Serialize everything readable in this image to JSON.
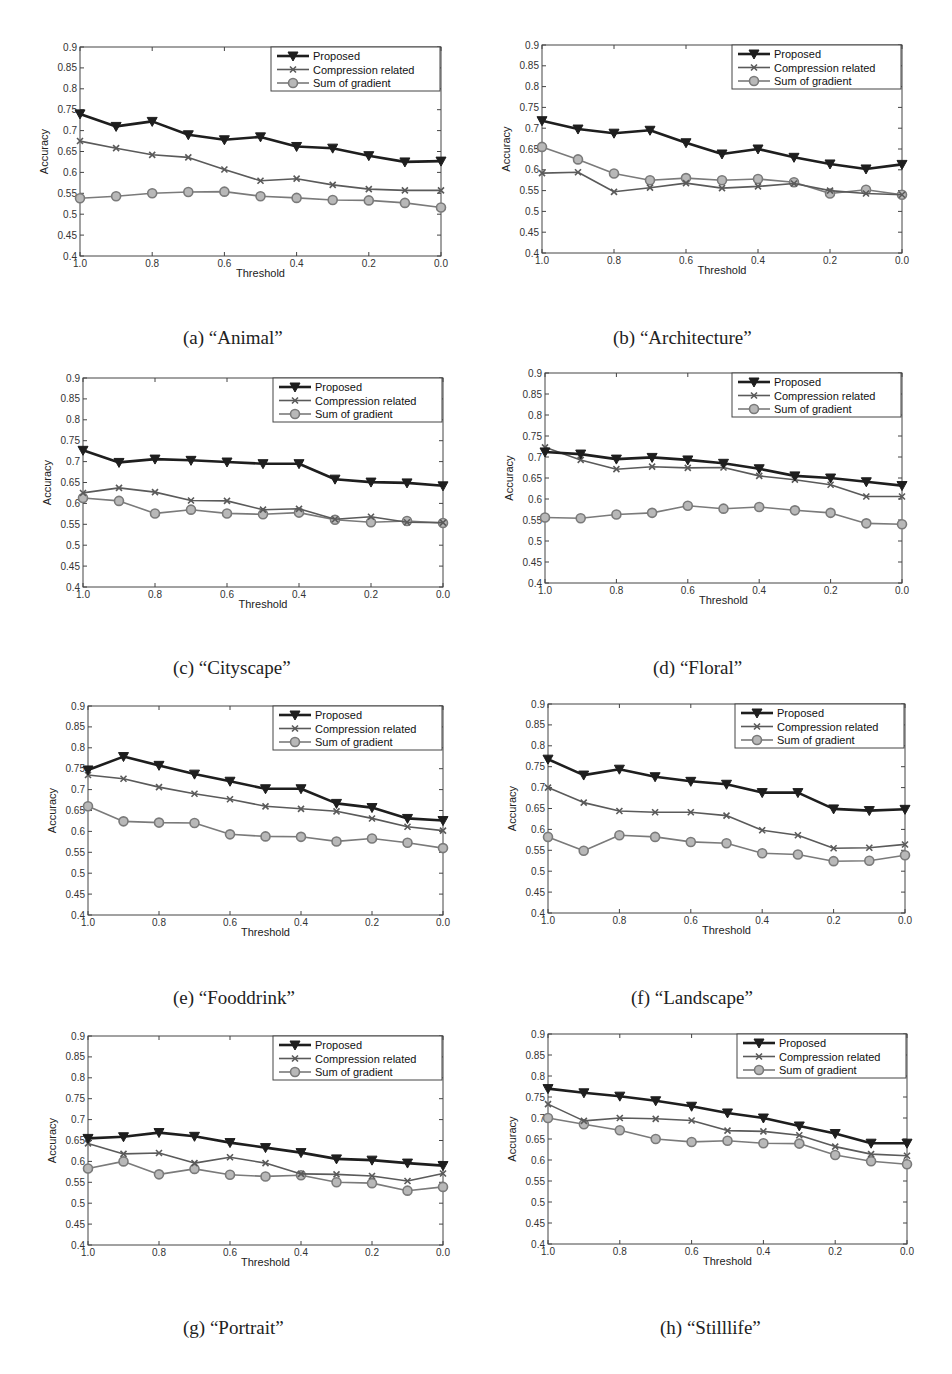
{
  "figure": {
    "x_ticks": [
      "1.0",
      "0.8",
      "0.6",
      "0.4",
      "0.2",
      "0.0"
    ],
    "y_ticks": [
      "0.4",
      "0.45",
      "0.5",
      "0.55",
      "0.6",
      "0.65",
      "0.7",
      "0.75",
      "0.8",
      "0.85",
      "0.9"
    ],
    "xlabel": "Threshold",
    "ylabel": "Accuracy",
    "legend": [
      "Proposed",
      "Compression related",
      "Sum of gradient"
    ],
    "colors": {
      "proposed": "#1e1e1e",
      "compression": "#5a5a5a",
      "gradient": "#7a7a7a"
    }
  },
  "chart_data": [
    {
      "type": "line",
      "title": "",
      "caption": "(a) “Animal”",
      "xlabel": "Threshold",
      "ylabel": "Accuracy",
      "ylim": [
        0.4,
        0.9
      ],
      "xlim": [
        1.0,
        0.0
      ],
      "grid": false,
      "legend_position": "upper right",
      "x": [
        1.0,
        0.9,
        0.8,
        0.7,
        0.6,
        0.5,
        0.4,
        0.3,
        0.2,
        0.1,
        0.0
      ],
      "series": [
        {
          "name": "Proposed",
          "marker": "triangle-down",
          "values": [
            0.74,
            0.71,
            0.722,
            0.69,
            0.678,
            0.685,
            0.662,
            0.658,
            0.64,
            0.625,
            0.627
          ]
        },
        {
          "name": "Compression related",
          "marker": "x",
          "values": [
            0.675,
            0.658,
            0.642,
            0.636,
            0.607,
            0.58,
            0.585,
            0.57,
            0.56,
            0.557,
            0.557
          ]
        },
        {
          "name": "Sum of gradient",
          "marker": "circle",
          "values": [
            0.538,
            0.543,
            0.55,
            0.553,
            0.554,
            0.543,
            0.539,
            0.534,
            0.533,
            0.527,
            0.516
          ]
        }
      ]
    },
    {
      "type": "line",
      "title": "",
      "caption": "(b) “Architecture”",
      "xlabel": "Threshold",
      "ylabel": "Accuracy",
      "ylim": [
        0.4,
        0.9
      ],
      "xlim": [
        1.0,
        0.0
      ],
      "grid": false,
      "legend_position": "upper right",
      "x": [
        1.0,
        0.9,
        0.8,
        0.7,
        0.6,
        0.5,
        0.4,
        0.3,
        0.2,
        0.1,
        0.0
      ],
      "series": [
        {
          "name": "Proposed",
          "marker": "triangle-down",
          "values": [
            0.718,
            0.698,
            0.688,
            0.695,
            0.665,
            0.638,
            0.65,
            0.63,
            0.614,
            0.602,
            0.613
          ]
        },
        {
          "name": "Compression related",
          "marker": "x",
          "values": [
            0.592,
            0.594,
            0.547,
            0.557,
            0.568,
            0.556,
            0.56,
            0.567,
            0.55,
            0.543,
            0.54
          ]
        },
        {
          "name": "Sum of gradient",
          "marker": "circle",
          "values": [
            0.655,
            0.625,
            0.591,
            0.575,
            0.58,
            0.575,
            0.578,
            0.57,
            0.543,
            0.552,
            0.54
          ]
        }
      ]
    },
    {
      "type": "line",
      "title": "",
      "caption": "(c) “Cityscape”",
      "xlabel": "Threshold",
      "ylabel": "Accuracy",
      "ylim": [
        0.4,
        0.9
      ],
      "xlim": [
        1.0,
        0.0
      ],
      "grid": false,
      "legend_position": "upper right",
      "x": [
        1.0,
        0.9,
        0.8,
        0.7,
        0.6,
        0.5,
        0.4,
        0.3,
        0.2,
        0.1,
        0.0
      ],
      "series": [
        {
          "name": "Proposed",
          "marker": "triangle-down",
          "values": [
            0.727,
            0.698,
            0.706,
            0.703,
            0.699,
            0.695,
            0.695,
            0.658,
            0.651,
            0.649,
            0.642
          ]
        },
        {
          "name": "Compression related",
          "marker": "x",
          "values": [
            0.625,
            0.637,
            0.627,
            0.607,
            0.606,
            0.585,
            0.587,
            0.562,
            0.568,
            0.555,
            0.554
          ]
        },
        {
          "name": "Sum of gradient",
          "marker": "circle",
          "values": [
            0.613,
            0.606,
            0.576,
            0.585,
            0.576,
            0.574,
            0.578,
            0.561,
            0.555,
            0.558,
            0.553
          ]
        }
      ]
    },
    {
      "type": "line",
      "title": "",
      "caption": "(d) “Floral”",
      "xlabel": "Threshold",
      "ylabel": "Accuracy",
      "ylim": [
        0.4,
        0.9
      ],
      "xlim": [
        1.0,
        0.0
      ],
      "grid": false,
      "legend_position": "upper right",
      "x": [
        1.0,
        0.9,
        0.8,
        0.7,
        0.6,
        0.5,
        0.4,
        0.3,
        0.2,
        0.1,
        0.0
      ],
      "series": [
        {
          "name": "Proposed",
          "marker": "triangle-down",
          "values": [
            0.712,
            0.707,
            0.695,
            0.699,
            0.693,
            0.685,
            0.672,
            0.655,
            0.65,
            0.641,
            0.632
          ]
        },
        {
          "name": "Compression related",
          "marker": "x",
          "values": [
            0.723,
            0.693,
            0.671,
            0.677,
            0.674,
            0.675,
            0.655,
            0.646,
            0.634,
            0.606,
            0.606
          ]
        },
        {
          "name": "Sum of gradient",
          "marker": "circle",
          "values": [
            0.556,
            0.554,
            0.563,
            0.567,
            0.584,
            0.577,
            0.581,
            0.573,
            0.567,
            0.542,
            0.54
          ]
        }
      ]
    },
    {
      "type": "line",
      "title": "",
      "caption": "(e) “Fooddrink”",
      "xlabel": "Threshold",
      "ylabel": "Accuracy",
      "ylim": [
        0.4,
        0.9
      ],
      "xlim": [
        1.0,
        0.0
      ],
      "grid": false,
      "legend_position": "upper right",
      "x": [
        1.0,
        0.9,
        0.8,
        0.7,
        0.6,
        0.5,
        0.4,
        0.3,
        0.2,
        0.1,
        0.0
      ],
      "series": [
        {
          "name": "Proposed",
          "marker": "triangle-down",
          "values": [
            0.747,
            0.779,
            0.758,
            0.737,
            0.72,
            0.702,
            0.702,
            0.667,
            0.657,
            0.631,
            0.626
          ]
        },
        {
          "name": "Compression related",
          "marker": "x",
          "values": [
            0.735,
            0.726,
            0.706,
            0.69,
            0.677,
            0.66,
            0.654,
            0.648,
            0.631,
            0.611,
            0.602
          ]
        },
        {
          "name": "Sum of gradient",
          "marker": "circle",
          "values": [
            0.66,
            0.624,
            0.621,
            0.62,
            0.593,
            0.588,
            0.587,
            0.576,
            0.583,
            0.573,
            0.56
          ]
        }
      ]
    },
    {
      "type": "line",
      "title": "",
      "caption": "(f) “Landscape”",
      "xlabel": "Threshold",
      "ylabel": "Accuracy",
      "ylim": [
        0.4,
        0.9
      ],
      "xlim": [
        1.0,
        0.0
      ],
      "grid": false,
      "legend_position": "upper right",
      "x": [
        1.0,
        0.9,
        0.8,
        0.7,
        0.6,
        0.5,
        0.4,
        0.3,
        0.2,
        0.1,
        0.0
      ],
      "series": [
        {
          "name": "Proposed",
          "marker": "triangle-down",
          "values": [
            0.768,
            0.73,
            0.744,
            0.726,
            0.715,
            0.708,
            0.688,
            0.688,
            0.649,
            0.645,
            0.648
          ]
        },
        {
          "name": "Compression related",
          "marker": "x",
          "values": [
            0.7,
            0.664,
            0.644,
            0.641,
            0.641,
            0.633,
            0.598,
            0.586,
            0.555,
            0.556,
            0.564
          ]
        },
        {
          "name": "Sum of gradient",
          "marker": "circle",
          "values": [
            0.582,
            0.549,
            0.586,
            0.582,
            0.57,
            0.567,
            0.543,
            0.54,
            0.524,
            0.525,
            0.538
          ]
        }
      ]
    },
    {
      "type": "line",
      "title": "",
      "caption": "(g) “Portrait”",
      "xlabel": "Threshold",
      "ylabel": "Accuracy",
      "ylim": [
        0.4,
        0.9
      ],
      "xlim": [
        1.0,
        0.0
      ],
      "grid": false,
      "legend_position": "upper right",
      "x": [
        1.0,
        0.9,
        0.8,
        0.7,
        0.6,
        0.5,
        0.4,
        0.3,
        0.2,
        0.1,
        0.0
      ],
      "series": [
        {
          "name": "Proposed",
          "marker": "triangle-down",
          "values": [
            0.655,
            0.659,
            0.669,
            0.66,
            0.645,
            0.633,
            0.621,
            0.606,
            0.603,
            0.596,
            0.59
          ]
        },
        {
          "name": "Compression related",
          "marker": "x",
          "values": [
            0.643,
            0.618,
            0.62,
            0.596,
            0.61,
            0.596,
            0.57,
            0.569,
            0.565,
            0.553,
            0.571
          ]
        },
        {
          "name": "Sum of gradient",
          "marker": "circle",
          "values": [
            0.583,
            0.6,
            0.569,
            0.582,
            0.568,
            0.564,
            0.567,
            0.55,
            0.548,
            0.53,
            0.539
          ]
        }
      ]
    },
    {
      "type": "line",
      "title": "",
      "caption": "(h) “Stilllife”",
      "xlabel": "Threshold",
      "ylabel": "Accuracy",
      "ylim": [
        0.4,
        0.9
      ],
      "xlim": [
        1.0,
        0.0
      ],
      "grid": false,
      "legend_position": "upper right",
      "x": [
        1.0,
        0.9,
        0.8,
        0.7,
        0.6,
        0.5,
        0.4,
        0.3,
        0.2,
        0.1,
        0.0
      ],
      "series": [
        {
          "name": "Proposed",
          "marker": "triangle-down",
          "values": [
            0.77,
            0.76,
            0.752,
            0.741,
            0.728,
            0.712,
            0.7,
            0.681,
            0.663,
            0.64,
            0.64
          ]
        },
        {
          "name": "Compression related",
          "marker": "x",
          "values": [
            0.733,
            0.693,
            0.7,
            0.698,
            0.694,
            0.67,
            0.668,
            0.659,
            0.632,
            0.614,
            0.61
          ]
        },
        {
          "name": "Sum of gradient",
          "marker": "circle",
          "values": [
            0.7,
            0.685,
            0.671,
            0.65,
            0.643,
            0.646,
            0.64,
            0.639,
            0.612,
            0.597,
            0.59
          ]
        }
      ]
    }
  ]
}
